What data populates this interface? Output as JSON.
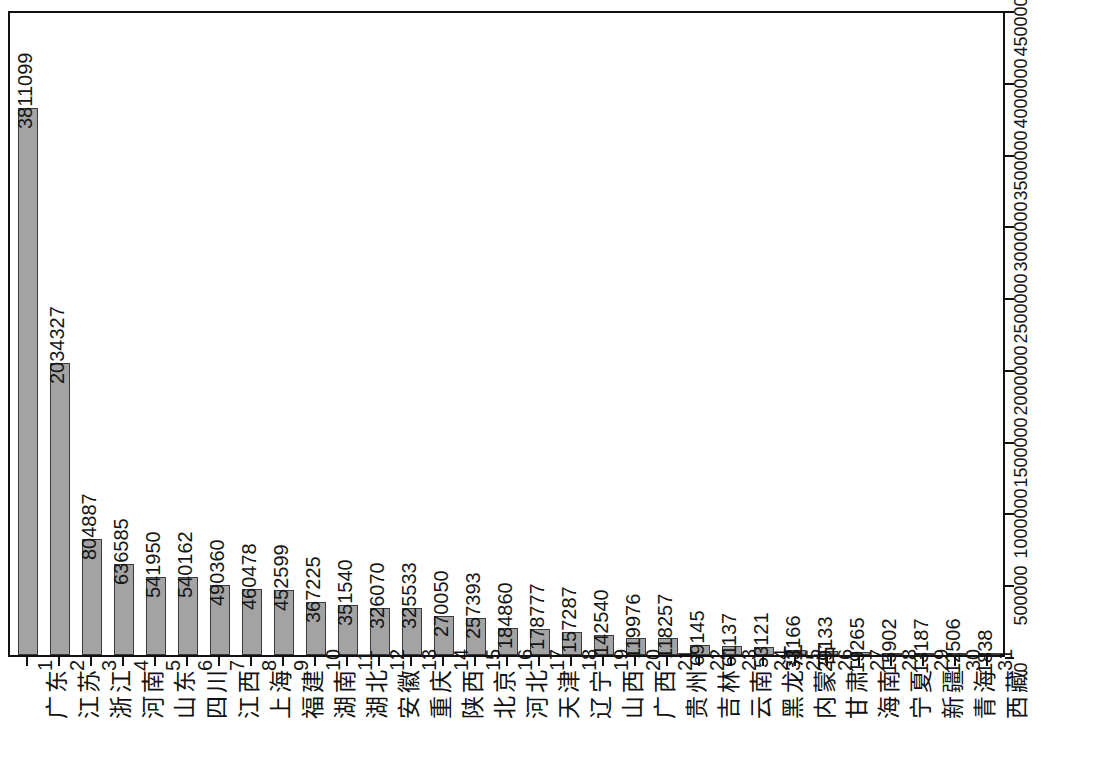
{
  "chart_data": {
    "type": "bar",
    "title": "",
    "xlabel": "",
    "ylabel": "",
    "ylim": [
      0,
      4500000
    ],
    "ytick_step": 500000,
    "yticks": [
      0,
      500000,
      1000000,
      1500000,
      2000000,
      2500000,
      3000000,
      3500000,
      4000000,
      4500000
    ],
    "ytick_labels": [
      "0",
      "500000",
      "1000000",
      "1500000",
      "2000000",
      "2500000",
      "3000000",
      "3500000",
      "4000000",
      "4500000"
    ],
    "axis_position": "right",
    "grid": false,
    "legend": "none",
    "bar_fill_color": "#a3a3a3",
    "bar_border_color": "#3a3a3a",
    "value_labels_shown": true,
    "label_rotation_deg": 90,
    "categories": [
      "广东",
      "江苏",
      "浙江",
      "河南",
      "山东",
      "四川",
      "江西",
      "上海",
      "福建",
      "湖南",
      "湖北",
      "安徽",
      "重庆",
      "陕西",
      "北京",
      "河北",
      "天津",
      "辽宁",
      "山西",
      "广西",
      "贵州",
      "吉林",
      "云南",
      "黑龙江",
      "内蒙古",
      "甘肃",
      "海南",
      "宁夏",
      "新疆",
      "青海",
      "西藏"
    ],
    "index_labels": [
      "1",
      "2",
      "3",
      "4",
      "5",
      "6",
      "7",
      "8",
      "9",
      "10",
      "11",
      "12",
      "13",
      "14",
      "15",
      "16",
      "17",
      "18",
      "19",
      "20",
      "21",
      "22",
      "23",
      "24",
      "25",
      "26",
      "27",
      "28",
      "29",
      "30",
      "31"
    ],
    "values": [
      3811099,
      2034327,
      804887,
      636585,
      541950,
      540162,
      490360,
      460478,
      452599,
      367225,
      351540,
      326070,
      325533,
      270050,
      257393,
      184860,
      178777,
      157287,
      142540,
      119976,
      118257,
      69145,
      61137,
      53121,
      33166,
      29133,
      19265,
      15902,
      13187,
      12506,
      1838
    ],
    "value_labels": [
      "3811099",
      "2034327",
      "804887",
      "636585",
      "541950",
      "540162",
      "490360",
      "460478",
      "452599",
      "367225",
      "351540",
      "326070",
      "325533",
      "270050",
      "257393",
      "184860",
      "178777",
      "157287",
      "142540",
      "119976",
      "118257",
      "69145",
      "61137",
      "53121",
      "33166",
      "29133",
      "19265",
      "15902",
      "13187",
      "12506",
      "1838"
    ]
  }
}
